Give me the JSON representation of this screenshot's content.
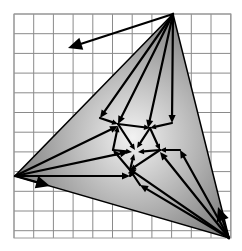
{
  "diagram": {
    "title": "",
    "canvas": {
      "width": 242,
      "height": 251
    },
    "grid": {
      "x0": 14,
      "y0": 14,
      "x1": 231,
      "y1": 238,
      "cell": 19.7,
      "color": "#8a8a8a",
      "border_color": "#9a9a9a"
    },
    "triangle": {
      "vertices": [
        [
          173,
          14
        ],
        [
          15,
          176
        ],
        [
          229,
          238
        ]
      ],
      "fill_center": "#f2f2f2",
      "fill_edge": "#7a7a7a",
      "stroke": "#000000"
    },
    "colors": {
      "arrow": "#000000",
      "background": "#ffffff"
    },
    "hub": [
      135,
      152
    ],
    "inner_points": [
      [
        118,
        124
      ],
      [
        150,
        128
      ],
      [
        160,
        150
      ],
      [
        130,
        170
      ],
      [
        113,
        152
      ],
      [
        140,
        140
      ],
      [
        125,
        140
      ]
    ],
    "arrows": [
      {
        "from": [
          173,
          14
        ],
        "to": [
          68,
          48
        ],
        "head": 14
      },
      {
        "from": [
          173,
          14
        ],
        "to": [
          118,
          124
        ],
        "head": 8
      },
      {
        "from": [
          173,
          14
        ],
        "to": [
          148,
          128
        ],
        "head": 8
      },
      {
        "from": [
          173,
          14
        ],
        "to": [
          172,
          123
        ],
        "head": 8
      },
      {
        "from": [
          173,
          14
        ],
        "to": [
          100,
          118
        ],
        "head": 8
      },
      {
        "from": [
          229,
          238
        ],
        "to": [
          218,
          207
        ],
        "head": 14
      },
      {
        "from": [
          229,
          238
        ],
        "to": [
          180,
          150
        ],
        "head": 8
      },
      {
        "from": [
          229,
          238
        ],
        "to": [
          160,
          152
        ],
        "head": 8
      },
      {
        "from": [
          229,
          238
        ],
        "to": [
          140,
          185
        ],
        "head": 8
      },
      {
        "from": [
          229,
          238
        ],
        "to": [
          128,
          168
        ],
        "head": 8
      },
      {
        "from": [
          15,
          176
        ],
        "to": [
          50,
          186
        ],
        "head": 14
      },
      {
        "from": [
          15,
          176
        ],
        "to": [
          130,
          176
        ],
        "head": 8
      },
      {
        "from": [
          15,
          176
        ],
        "to": [
          118,
          126
        ],
        "head": 8
      },
      {
        "from": [
          15,
          176
        ],
        "to": [
          128,
          152
        ],
        "head": 8
      },
      {
        "from": [
          118,
          124
        ],
        "to": [
          150,
          128
        ],
        "head": 6
      },
      {
        "from": [
          150,
          128
        ],
        "to": [
          160,
          150
        ],
        "head": 6
      },
      {
        "from": [
          160,
          150
        ],
        "to": [
          130,
          170
        ],
        "head": 6
      },
      {
        "from": [
          130,
          170
        ],
        "to": [
          113,
          150
        ],
        "head": 6
      },
      {
        "from": [
          113,
          150
        ],
        "to": [
          118,
          126
        ],
        "head": 6
      },
      {
        "from": [
          118,
          124
        ],
        "to": [
          135,
          150
        ],
        "head": 6
      },
      {
        "from": [
          150,
          128
        ],
        "to": [
          137,
          148
        ],
        "head": 6
      },
      {
        "from": [
          160,
          150
        ],
        "to": [
          138,
          152
        ],
        "head": 6
      },
      {
        "from": [
          130,
          170
        ],
        "to": [
          134,
          154
        ],
        "head": 6
      },
      {
        "from": [
          113,
          150
        ],
        "to": [
          132,
          152
        ],
        "head": 6
      },
      {
        "from": [
          100,
          118
        ],
        "to": [
          118,
          124
        ],
        "head": 6
      },
      {
        "from": [
          172,
          123
        ],
        "to": [
          150,
          128
        ],
        "head": 6
      },
      {
        "from": [
          180,
          150
        ],
        "to": [
          160,
          150
        ],
        "head": 6
      },
      {
        "from": [
          140,
          185
        ],
        "to": [
          130,
          170
        ],
        "head": 6
      },
      {
        "from": [
          130,
          176
        ],
        "to": [
          132,
          168
        ],
        "head": 6
      }
    ]
  }
}
